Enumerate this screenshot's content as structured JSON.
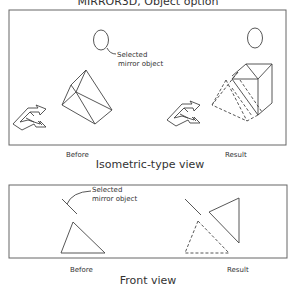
{
  "title": "MIRROR3D, Object option",
  "isometric_panel": {
    "caption": "Isometric-type view",
    "before_label": "Before",
    "result_label": "Result",
    "callout_line1": "Selected",
    "callout_line2": "mirror object"
  },
  "front_panel": {
    "caption": "Front view",
    "before_label": "Before",
    "result_label": "Result",
    "callout_line1": "Selected",
    "callout_line2": "mirror object"
  }
}
